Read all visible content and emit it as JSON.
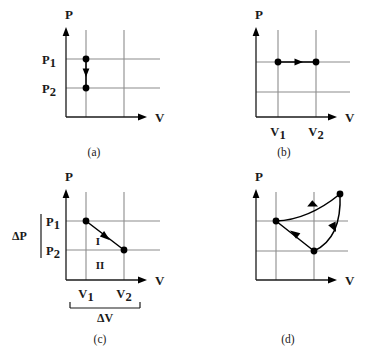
{
  "figure": {
    "title": "",
    "background_color": "#ffffff",
    "grid_color": "#8c8c8c",
    "axis_color": "#1a1a1a",
    "path_color": "#000000"
  },
  "panels": [
    {
      "id": "a",
      "caption": "(a)",
      "y_axis_label": "P",
      "x_axis_label": "V",
      "y_tick_labels": [
        {
          "base": "P",
          "sub": "1"
        },
        {
          "base": "P",
          "sub": "2"
        }
      ],
      "x_tick_labels": [],
      "process": "isochoric-pressure-decrease",
      "points": [
        {
          "label": "P1",
          "v": 1,
          "p": 1
        },
        {
          "label": "P2",
          "v": 1,
          "p": 2
        }
      ],
      "arrow_direction": "down"
    },
    {
      "id": "b",
      "caption": "(b)",
      "y_axis_label": "P",
      "x_axis_label": "V",
      "y_tick_labels": [],
      "x_tick_labels": [
        {
          "base": "V",
          "sub": "1"
        },
        {
          "base": "V",
          "sub": "2"
        }
      ],
      "process": "isobaric-volume-increase",
      "points": [
        {
          "label": "V1",
          "v": 1,
          "p": 1
        },
        {
          "label": "V2",
          "v": 2,
          "p": 1
        }
      ],
      "arrow_direction": "right"
    },
    {
      "id": "c",
      "caption": "(c)",
      "y_axis_label": "P",
      "x_axis_label": "V",
      "y_tick_labels": [
        {
          "base": "P",
          "sub": "1"
        },
        {
          "base": "P",
          "sub": "2"
        }
      ],
      "x_tick_labels": [
        {
          "base": "V",
          "sub": "1"
        },
        {
          "base": "V",
          "sub": "2"
        }
      ],
      "delta_p_label": "ΔP",
      "delta_v_label": "ΔV",
      "region_labels": [
        "I",
        "II"
      ],
      "process": "linear-expansion-with-pressure-drop",
      "points": [
        {
          "label": "start",
          "v": 1,
          "p": 1
        },
        {
          "label": "end",
          "v": 2,
          "p": 2
        }
      ],
      "arrow_direction": "down-right"
    },
    {
      "id": "d",
      "caption": "(d)",
      "y_axis_label": "P",
      "x_axis_label": "V",
      "y_tick_labels": [],
      "x_tick_labels": [],
      "process": "closed-cycle-three-stage",
      "points": [
        {
          "label": "left",
          "v": 1,
          "p": 1
        },
        {
          "label": "top-right",
          "v": 3,
          "p": 0
        },
        {
          "label": "bottom-middle",
          "v": 2,
          "p": 2
        }
      ],
      "arrow_direction": "counterclockwise-cycle"
    }
  ]
}
